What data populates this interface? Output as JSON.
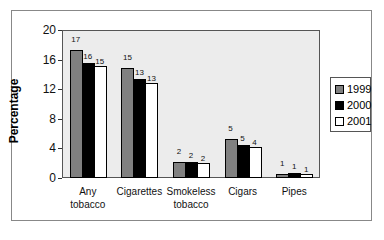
{
  "chart_data": {
    "type": "bar",
    "title": "",
    "xlabel": "",
    "ylabel": "Percentage",
    "ylim": [
      0,
      20
    ],
    "yticks": [
      0,
      4,
      8,
      12,
      16,
      20
    ],
    "categories": [
      "Any tobacco",
      "Cigarettes",
      "Smokeless tobacco",
      "Cigars",
      "Pipes"
    ],
    "category_lines": [
      [
        "Any",
        "tobacco"
      ],
      [
        "Cigarettes",
        ""
      ],
      [
        "Smokeless",
        "tobacco"
      ],
      [
        "Cigars",
        ""
      ],
      [
        "Pipes",
        ""
      ]
    ],
    "series": [
      {
        "name": "1999",
        "color": "#808080",
        "values": [
          17.3,
          14.9,
          2.2,
          5.3,
          0.6
        ],
        "labels": [
          "17",
          "15",
          "2",
          "5",
          "1"
        ]
      },
      {
        "name": "2000",
        "color": "#000000",
        "values": [
          15.6,
          13.4,
          2.1,
          4.4,
          0.7
        ],
        "labels": [
          "16",
          "13",
          "2",
          "5",
          "1"
        ]
      },
      {
        "name": "2001",
        "color": "#ffffff",
        "values": [
          15.1,
          12.9,
          2.0,
          4.2,
          0.6
        ],
        "labels": [
          "15",
          "13",
          "2",
          "4",
          "1"
        ]
      }
    ],
    "legend_position": "right",
    "grid": false
  }
}
